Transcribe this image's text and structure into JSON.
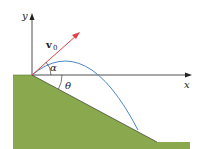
{
  "diagram": {
    "labels": {
      "y_axis": "y",
      "x_axis": "x",
      "velocity": "v",
      "velocity_sub": "0",
      "alpha": "α",
      "theta": "θ"
    },
    "colors": {
      "ground": "#8aa84e",
      "trajectory": "#4a86c8",
      "velocity_vector": "#e0404a",
      "axes": "#222222"
    }
  }
}
